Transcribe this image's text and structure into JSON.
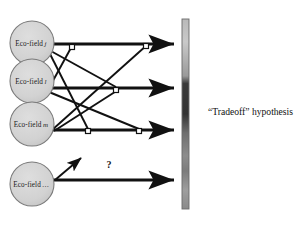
{
  "figure": {
    "title": "",
    "background_color": "#ffffff",
    "nodes": [
      {
        "id": "eco-j",
        "label": "Eco-field",
        "subscript": "j",
        "cx": 32,
        "cy": 43,
        "r": 22,
        "fill": "#d4d4d4",
        "stroke": "#7a7a7a"
      },
      {
        "id": "eco-l",
        "label": "Eco-field",
        "subscript": "l",
        "cx": 32,
        "cy": 81,
        "r": 22,
        "fill": "#d4d4d4",
        "stroke": "#7a7a7a"
      },
      {
        "id": "eco-m",
        "label": "Eco-field",
        "subscript": "m",
        "cx": 32,
        "cy": 124,
        "r": 22,
        "fill": "#d4d4d4",
        "stroke": "#7a7a7a"
      },
      {
        "id": "eco-dots",
        "label": "Eco-field",
        "subscript": "…",
        "cx": 32,
        "cy": 184,
        "r": 22,
        "fill": "#d4d4d4",
        "stroke": "#7a7a7a"
      }
    ],
    "main_arrows": [
      {
        "id": "arrow-row-1",
        "x1": 52,
        "y1": 44,
        "x2": 176,
        "y2": 44,
        "color": "#111111"
      },
      {
        "id": "arrow-row-2",
        "x1": 52,
        "y1": 88,
        "x2": 176,
        "y2": 88,
        "color": "#111111"
      },
      {
        "id": "arrow-row-3",
        "x1": 52,
        "y1": 130,
        "x2": 176,
        "y2": 130,
        "color": "#111111"
      },
      {
        "id": "arrow-row-4",
        "x1": 52,
        "y1": 180,
        "x2": 176,
        "y2": 180,
        "color": "#111111"
      }
    ],
    "cross_links": [
      {
        "id": "link-j-to-row2",
        "x1": 49,
        "y1": 50,
        "x2": 116,
        "y2": 87,
        "color": "#111111"
      },
      {
        "id": "link-j-to-row3",
        "x1": 49,
        "y1": 52,
        "x2": 88,
        "y2": 129,
        "color": "#111111"
      },
      {
        "id": "link-l-to-row1",
        "x1": 49,
        "y1": 88,
        "x2": 72,
        "y2": 46,
        "color": "#111111"
      },
      {
        "id": "link-l-to-row3",
        "x1": 49,
        "y1": 92,
        "x2": 139,
        "y2": 129,
        "color": "#111111"
      },
      {
        "id": "link-m-to-row1",
        "x1": 52,
        "y1": 130,
        "x2": 147,
        "y2": 45,
        "color": "#111111"
      },
      {
        "id": "link-m-to-row2",
        "x1": 54,
        "y1": 131,
        "x2": 118,
        "y2": 90,
        "color": "#111111"
      }
    ],
    "junction_markers": [
      {
        "id": "junction-1",
        "x": 72,
        "y": 47
      },
      {
        "id": "junction-2",
        "x": 146,
        "y": 46
      },
      {
        "id": "junction-3",
        "x": 116,
        "y": 90
      },
      {
        "id": "junction-4",
        "x": 88,
        "y": 131
      },
      {
        "id": "junction-5",
        "x": 139,
        "y": 131
      }
    ],
    "question_arrow": {
      "id": "unknown-link-arrow",
      "x1": 55,
      "y1": 180,
      "x2": 81,
      "y2": 158,
      "color": "#111111"
    },
    "question_mark": {
      "text": "?",
      "x": 109,
      "y": 166
    },
    "gradient_bar": {
      "id": "tradeoff-gradient-bar",
      "x": 182,
      "y": 19,
      "width": 7,
      "height": 190,
      "stroke": "#555555",
      "stops": [
        {
          "offset": 0,
          "color": "#b9b9b9"
        },
        {
          "offset": 0.12,
          "color": "#c9c9c9"
        },
        {
          "offset": 0.3,
          "color": "#9a9a9a"
        },
        {
          "offset": 0.34,
          "color": "#3a3a3a"
        },
        {
          "offset": 0.5,
          "color": "#333333"
        },
        {
          "offset": 0.6,
          "color": "#6f6f6f"
        },
        {
          "offset": 0.72,
          "color": "#8d8d8d"
        },
        {
          "offset": 0.8,
          "color": "#7c7c7c"
        },
        {
          "offset": 0.9,
          "color": "#9e9e9e"
        },
        {
          "offset": 1,
          "color": "#8a8a8a"
        }
      ]
    },
    "hypothesis_label": {
      "text": "“Tradeoff” hypothesis",
      "x": 208,
      "y": 113
    }
  }
}
